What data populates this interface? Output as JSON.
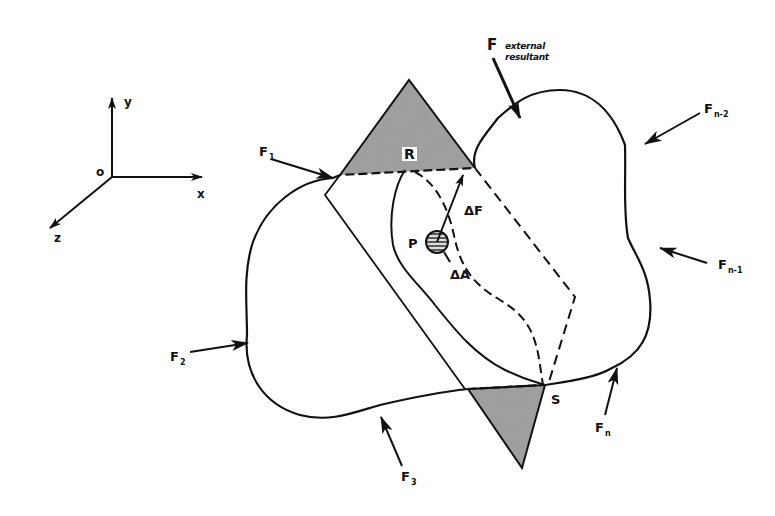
{
  "diagram": {
    "type": "free-body section diagram",
    "axes": {
      "origin": "o",
      "x": "x",
      "y": "y",
      "z": "z"
    },
    "external_resultant": {
      "symbol": "F",
      "note_line1": "external",
      "note_line2": "resultant"
    },
    "forces": [
      {
        "symbol": "F",
        "sub": "1"
      },
      {
        "symbol": "F",
        "sub": "2"
      },
      {
        "symbol": "F",
        "sub": "3"
      },
      {
        "symbol": "F",
        "sub": "n"
      },
      {
        "symbol": "F",
        "sub": "n-1"
      },
      {
        "symbol": "F",
        "sub": "n-2"
      }
    ],
    "points": {
      "R": "R",
      "S": "S",
      "P": "P"
    },
    "element": {
      "force_increment": "ΔF",
      "area_increment": "ΔA"
    },
    "colors": {
      "ink": "#111111",
      "shade": "#8a8a8a",
      "background": "#ffffff"
    }
  }
}
